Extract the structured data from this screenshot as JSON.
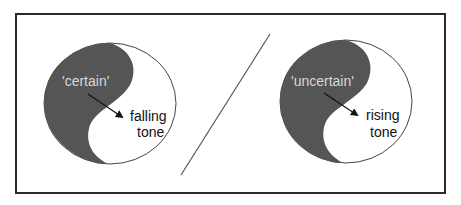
{
  "diagram": {
    "colors": {
      "frame": "#2a2a2a",
      "dark_fill": "#555555",
      "light_fill": "#ffffff",
      "outline": "#444444",
      "divider": "#555555"
    },
    "left": {
      "meaning": "'certain'",
      "tone_line1": "falling",
      "tone_line2": "tone"
    },
    "right": {
      "meaning": "'uncertain'",
      "tone_line1": "rising",
      "tone_line2": "tone"
    }
  }
}
